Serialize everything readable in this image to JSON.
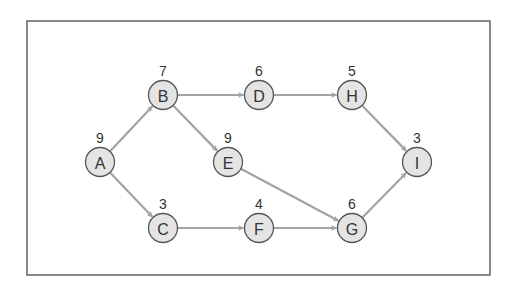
{
  "diagram": {
    "type": "directed-graph",
    "colors": {
      "frame": "#4a4a4a",
      "edge": "#a3a3a3",
      "node_fill": "#e4e4e4",
      "node_stroke": "#555555",
      "text": "#333333"
    },
    "nodes": [
      {
        "id": "A",
        "label": "A",
        "weight": "9",
        "x": 100,
        "y": 162
      },
      {
        "id": "B",
        "label": "B",
        "weight": "7",
        "x": 163,
        "y": 95
      },
      {
        "id": "C",
        "label": "C",
        "weight": "3",
        "x": 163,
        "y": 228
      },
      {
        "id": "D",
        "label": "D",
        "weight": "6",
        "x": 259,
        "y": 95
      },
      {
        "id": "E",
        "label": "E",
        "weight": "9",
        "x": 228,
        "y": 162
      },
      {
        "id": "F",
        "label": "F",
        "weight": "4",
        "x": 259,
        "y": 228
      },
      {
        "id": "G",
        "label": "G",
        "weight": "6",
        "x": 352,
        "y": 228
      },
      {
        "id": "H",
        "label": "H",
        "weight": "5",
        "x": 352,
        "y": 95
      },
      {
        "id": "I",
        "label": "I",
        "weight": "3",
        "x": 417,
        "y": 162
      }
    ],
    "edges": [
      {
        "from": "A",
        "to": "B"
      },
      {
        "from": "A",
        "to": "C"
      },
      {
        "from": "B",
        "to": "D"
      },
      {
        "from": "B",
        "to": "E"
      },
      {
        "from": "D",
        "to": "H"
      },
      {
        "from": "H",
        "to": "I"
      },
      {
        "from": "E",
        "to": "G"
      },
      {
        "from": "C",
        "to": "F"
      },
      {
        "from": "F",
        "to": "G"
      },
      {
        "from": "G",
        "to": "I"
      }
    ]
  }
}
